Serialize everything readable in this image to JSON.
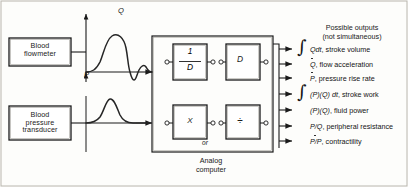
{
  "diagram": {
    "input_blocks": [
      {
        "name": "blood-flowmeter",
        "lines": [
          "Blood",
          "flowmeter"
        ]
      },
      {
        "name": "blood-pressure-transducer",
        "lines": [
          "Blood",
          "pressure",
          "transducer"
        ]
      }
    ],
    "signal_axes": {
      "flow_axis_label": "Q",
      "pressure_axis_label": "P"
    },
    "analog_computer": {
      "caption_lines": [
        "Analog",
        "computer"
      ],
      "or_label": "or",
      "operators": [
        {
          "name": "integrator",
          "numerator": "1",
          "denominator": "D"
        },
        {
          "name": "differentiator",
          "symbol": "D"
        },
        {
          "name": "multiplier",
          "symbol": "X"
        },
        {
          "name": "divider",
          "symbol": "÷"
        }
      ]
    },
    "outputs": {
      "title_line1": "Possible outputs",
      "title_line2": "(not simultaneous)",
      "items": [
        {
          "integral": true,
          "expr": "Qdt",
          "desc": ", stroke volume",
          "dot_on": "none"
        },
        {
          "integral": false,
          "expr": "Q",
          "desc": ", flow acceleration",
          "dot_on": "Q"
        },
        {
          "integral": false,
          "expr": "P",
          "desc": ", pressure rise rate",
          "dot_on": "P"
        },
        {
          "integral": true,
          "expr": "(P)(Q) dt",
          "desc": ", stroke work",
          "dot_on": "none"
        },
        {
          "integral": false,
          "expr": "(P)(Q)",
          "desc": ", fluid power",
          "dot_on": "none"
        },
        {
          "integral": false,
          "expr": "P/Q",
          "desc": ", peripheral resistance",
          "dot_on": "none"
        },
        {
          "integral": false,
          "expr": "P/P",
          "desc": ", contractility",
          "dot_on": "P"
        }
      ]
    }
  }
}
